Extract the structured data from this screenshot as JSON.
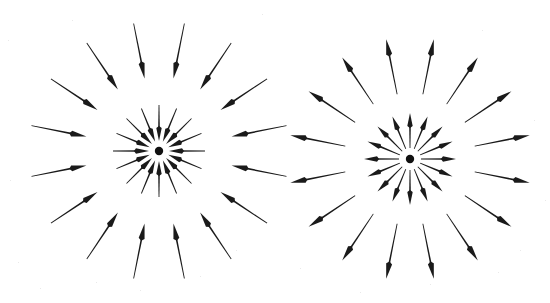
{
  "figure": {
    "background_color": "#ffffff",
    "stroke_color": "#1a1a1a",
    "width": 550,
    "height": 303,
    "caption": ""
  },
  "panels": [
    {
      "id": "left-panel",
      "name": "converging-radial-field",
      "label": "Field lines directed inward",
      "polarity": "negative",
      "direction": "inward",
      "center": {
        "x": 159,
        "y": 151
      },
      "charge_dot": {
        "radius": 4.2,
        "color": "#111111"
      },
      "rings": [
        {
          "name": "inner-ring",
          "count": 16,
          "angle_offset_deg": 0,
          "tip_radius": 10,
          "tail_radius": 46,
          "head_length": 13,
          "head_width": 5.4,
          "shaft_width": 1.5
        },
        {
          "name": "outer-ring",
          "count": 16,
          "angle_offset_deg": 11.25,
          "tip_radius": 74,
          "tail_radius": 130,
          "head_length": 15,
          "head_width": 6.0,
          "shaft_width": 1.5
        }
      ]
    },
    {
      "id": "right-panel",
      "name": "diverging-radial-field",
      "label": "Field lines directed outward",
      "polarity": "positive",
      "direction": "outward",
      "center": {
        "x": 410,
        "y": 159
      },
      "charge_dot": {
        "radius": 4.2,
        "color": "#111111"
      },
      "rings": [
        {
          "name": "inner-ring",
          "count": 16,
          "angle_offset_deg": 0,
          "tip_radius": 46,
          "tail_radius": 11,
          "head_length": 13,
          "head_width": 5.4,
          "shaft_width": 1.5
        },
        {
          "name": "outer-ring",
          "count": 16,
          "angle_offset_deg": 11.25,
          "tip_radius": 122,
          "tail_radius": 66,
          "head_length": 15,
          "head_width": 6.0,
          "shaft_width": 1.5
        }
      ]
    }
  ]
}
